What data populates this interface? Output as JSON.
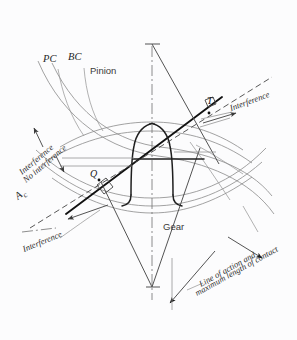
{
  "figure": {
    "background_color": "#fcfcfd",
    "ink_color": "#1f1f1f",
    "thin_line_color": "#8d8d8d"
  },
  "labels": {
    "pinion": "Pinion",
    "gear": "Gear",
    "pc_top": "PC",
    "bc_top": "BC",
    "pc_right": "PC",
    "bc_right": "BC",
    "point_t": "T",
    "point_q": "Q",
    "symbol_rc": "A",
    "symbol_rc_sub": "c",
    "interference_right": "Interference",
    "interference_left_upper": "Interference",
    "no_interference_left": "No interference",
    "interference_left_lower": "Interference",
    "line_of_action_1": "Line of action and",
    "line_of_action_2": "maximum length of contact"
  },
  "geometry": {
    "centerline_x": 152,
    "apex_y": 42,
    "pitch_point_y": 169,
    "point_t": {
      "x": 211,
      "y": 105
    },
    "point_q": {
      "x": 99,
      "y": 179
    },
    "line_of_action_angle_deg": 37
  }
}
